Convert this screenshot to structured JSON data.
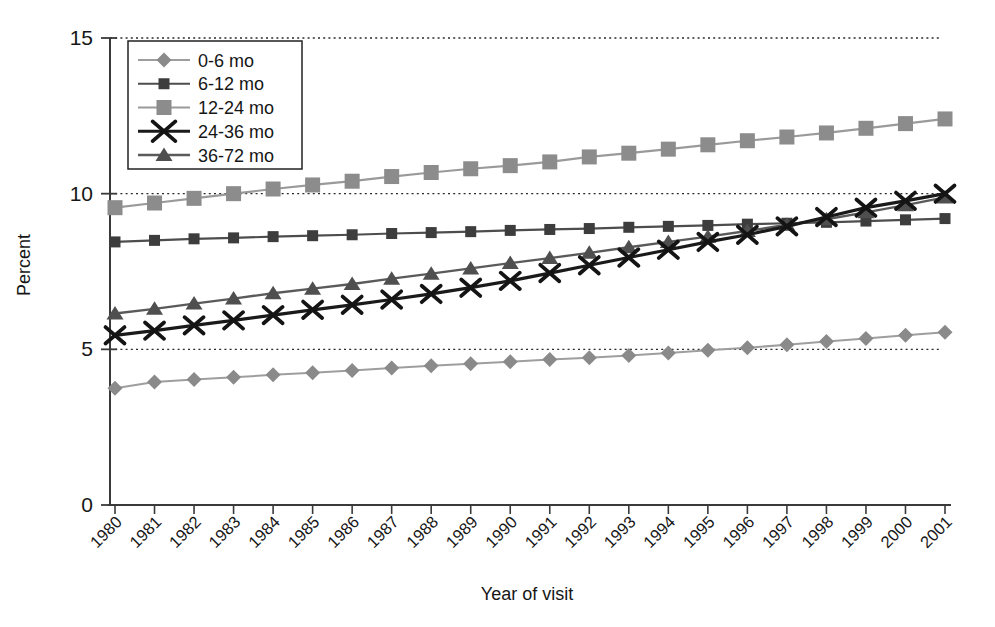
{
  "figure": {
    "background": "#ffffff",
    "text_color": "#161616",
    "axis_color": "#3a3a3a",
    "gridline_color": "#2b2b2b"
  },
  "chart_data": {
    "type": "line",
    "title": "",
    "xlabel": "Year of visit",
    "ylabel": "Percent",
    "x": [
      1980,
      1981,
      1982,
      1983,
      1984,
      1985,
      1986,
      1987,
      1988,
      1989,
      1990,
      1991,
      1992,
      1993,
      1994,
      1995,
      1996,
      1997,
      1998,
      1999,
      2000,
      2001
    ],
    "x_tick_labels": [
      "1980",
      "1981",
      "1982",
      "1983",
      "1984",
      "1985",
      "1986",
      "1987",
      "1988",
      "1989",
      "1990",
      "1991",
      "1992",
      "1993",
      "1994",
      "1995",
      "1996",
      "1997",
      "1998",
      "1999",
      "2000",
      "2001"
    ],
    "ylim": [
      0,
      15
    ],
    "yticks": [
      0,
      5,
      10,
      15
    ],
    "y_tick_labels": [
      "0",
      "5",
      "10",
      "15"
    ],
    "grid": "horizontal dotted lines at y=5, 10, 15",
    "legend_position": "top-left inside plot area",
    "series": [
      {
        "name": "0-6 mo",
        "marker": "diamond",
        "marker_color": "#8a8a8a",
        "line_color": "#9e9e9e",
        "values": [
          3.75,
          3.95,
          4.03,
          4.1,
          4.18,
          4.25,
          4.32,
          4.4,
          4.47,
          4.54,
          4.6,
          4.67,
          4.73,
          4.8,
          4.88,
          4.97,
          5.05,
          5.15,
          5.25,
          5.35,
          5.45,
          5.55
        ]
      },
      {
        "name": "6-12 mo",
        "marker": "square-small",
        "marker_color": "#3d3d3d",
        "line_color": "#4d4d4d",
        "values": [
          8.45,
          8.5,
          8.55,
          8.58,
          8.62,
          8.65,
          8.68,
          8.72,
          8.75,
          8.78,
          8.82,
          8.85,
          8.88,
          8.92,
          8.95,
          8.98,
          9.02,
          9.05,
          9.08,
          9.12,
          9.16,
          9.2
        ]
      },
      {
        "name": "12-24 mo",
        "marker": "square-large",
        "marker_color": "#8c8c8c",
        "line_color": "#9a9a9a",
        "values": [
          9.55,
          9.7,
          9.85,
          10.0,
          10.15,
          10.28,
          10.4,
          10.55,
          10.68,
          10.8,
          10.9,
          11.02,
          11.18,
          11.3,
          11.43,
          11.57,
          11.7,
          11.82,
          11.95,
          12.1,
          12.25,
          12.4
        ]
      },
      {
        "name": "24-36 mo",
        "marker": "x",
        "marker_color": "#141414",
        "line_color": "#1a1a1a",
        "values": [
          5.45,
          5.6,
          5.77,
          5.93,
          6.1,
          6.27,
          6.43,
          6.6,
          6.78,
          6.98,
          7.2,
          7.45,
          7.7,
          7.95,
          8.2,
          8.45,
          8.68,
          8.95,
          9.25,
          9.55,
          9.77,
          10.0
        ]
      },
      {
        "name": "36-72 mo",
        "marker": "triangle",
        "marker_color": "#4f4f4f",
        "line_color": "#5a5a5a",
        "values": [
          6.15,
          6.3,
          6.47,
          6.63,
          6.8,
          6.95,
          7.1,
          7.27,
          7.43,
          7.6,
          7.77,
          7.93,
          8.1,
          8.28,
          8.45,
          8.62,
          8.8,
          9.0,
          9.18,
          9.4,
          9.63,
          9.88
        ]
      }
    ]
  }
}
